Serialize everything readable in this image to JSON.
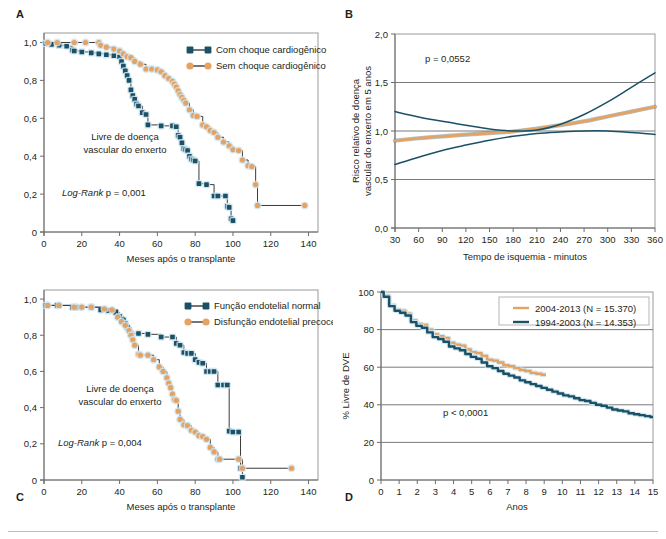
{
  "figure": {
    "panel_letters": {
      "a": "A",
      "b": "B",
      "c": "C",
      "d": "D"
    }
  },
  "colors": {
    "blue": "#1b5166",
    "orange": "#e4a263",
    "blue_legend_line": "#3a3a3a",
    "axis": "#6d6d6d",
    "grid": "#7a7a7a",
    "halo": "#cfe4ee",
    "text": "#231f20"
  },
  "chart_data": [
    {
      "id": "panel_a",
      "type": "line",
      "panel": "A",
      "title": "",
      "xlabel": "Meses após o transplante",
      "ylabel": "",
      "xlim": [
        0,
        145
      ],
      "ylim": [
        0,
        1.05
      ],
      "xticks": [
        0,
        20,
        40,
        60,
        80,
        100,
        120,
        140
      ],
      "xticklabels": [
        "0",
        "20",
        "40",
        "60",
        "80",
        "100",
        "120",
        "140"
      ],
      "yticks": [
        0,
        0.2,
        0.4,
        0.6,
        0.8,
        1.0
      ],
      "yticklabels": [
        "0",
        "0,2",
        "0,4",
        "0,6",
        "0,8",
        "1,0"
      ],
      "grid": false,
      "legend_position": "top-right",
      "annotations": [
        "Livre de doença",
        "vascular do enxerto",
        "Log-Rank p = 0,001"
      ],
      "annotation_stat": "Log-Rank p = 0,001",
      "series": [
        {
          "name": "Com choque cardiogênico",
          "color": "#1b5166",
          "marker": "square",
          "x": [
            1,
            4,
            8,
            12,
            15,
            16,
            20,
            25,
            29,
            33,
            37,
            40,
            41,
            42,
            43,
            44,
            45,
            46,
            47,
            48,
            49,
            50,
            52,
            54,
            55,
            62,
            68,
            70,
            71,
            72,
            73,
            74,
            75,
            76,
            77,
            78,
            79,
            80,
            82,
            86,
            90,
            92,
            96,
            97,
            98,
            99,
            100
          ],
          "y": [
            0.995,
            0.99,
            0.985,
            0.98,
            0.96,
            0.955,
            0.95,
            0.945,
            0.94,
            0.935,
            0.93,
            0.925,
            0.9,
            0.875,
            0.85,
            0.825,
            0.8,
            0.75,
            0.72,
            0.7,
            0.675,
            0.665,
            0.63,
            0.62,
            0.565,
            0.56,
            0.56,
            0.555,
            0.51,
            0.5,
            0.47,
            0.44,
            0.435,
            0.43,
            0.4,
            0.385,
            0.38,
            0.375,
            0.255,
            0.25,
            0.19,
            0.19,
            0.19,
            0.135,
            0.13,
            0.07,
            0.06
          ]
        },
        {
          "name": "Sem choque cardiogênico",
          "color": "#e4a263",
          "marker": "circle",
          "x": [
            2,
            7,
            16,
            22,
            29,
            30,
            33,
            37,
            40,
            42,
            44,
            46,
            48,
            51,
            54,
            57,
            60,
            62,
            64,
            66,
            68,
            69,
            70,
            71,
            72,
            73,
            74,
            75,
            77,
            79,
            81,
            84,
            86,
            88,
            90,
            92,
            95,
            98,
            100,
            103,
            105,
            108,
            110,
            112,
            113,
            138
          ],
          "y": [
            1.0,
            1.0,
            1.0,
            1.0,
            1.0,
            0.985,
            0.975,
            0.965,
            0.955,
            0.94,
            0.925,
            0.92,
            0.9,
            0.885,
            0.86,
            0.86,
            0.855,
            0.845,
            0.825,
            0.81,
            0.795,
            0.78,
            0.765,
            0.745,
            0.725,
            0.71,
            0.695,
            0.68,
            0.645,
            0.615,
            0.61,
            0.565,
            0.555,
            0.535,
            0.525,
            0.5,
            0.475,
            0.455,
            0.435,
            0.43,
            0.38,
            0.35,
            0.345,
            0.25,
            0.14,
            0.14
          ]
        }
      ]
    },
    {
      "id": "panel_b",
      "type": "line",
      "panel": "B",
      "title": "",
      "xlabel": "Tempo de isquemia - minutos",
      "ylabel": "Risco relativo de doença vascular do enxerto em 5 anos",
      "ylabel_lines": [
        "Risco relativo de doença",
        "vascular do enxerto em 5 anos"
      ],
      "xlim": [
        30,
        360
      ],
      "ylim": [
        0,
        2.0
      ],
      "xticks": [
        30,
        60,
        90,
        120,
        150,
        180,
        210,
        240,
        270,
        300,
        330,
        360
      ],
      "xticklabels": [
        "30",
        "60",
        "90",
        "120",
        "150",
        "180",
        "210",
        "240",
        "270",
        "300",
        "330",
        "360"
      ],
      "yticks": [
        0,
        0.5,
        1.0,
        1.5,
        2.0
      ],
      "yticklabels": [
        "0,0",
        "0,5",
        "1,0",
        "1,5",
        "2,0"
      ],
      "grid": true,
      "gridlines_y": [
        0.5,
        1.0,
        1.5
      ],
      "annotations": [
        "p = 0,0552"
      ],
      "annotation_stat": "p = 0,0552",
      "series": [
        {
          "name": "Estimativa",
          "color": "#e4a263",
          "x": [
            30,
            60,
            90,
            120,
            150,
            180,
            210,
            240,
            270,
            300,
            330,
            360
          ],
          "y": [
            0.9,
            0.925,
            0.945,
            0.962,
            0.978,
            0.995,
            1.025,
            1.06,
            1.1,
            1.15,
            1.2,
            1.25
          ]
        },
        {
          "name": "Limite superior",
          "color": "#1b5166",
          "x": [
            30,
            60,
            90,
            120,
            150,
            180,
            210,
            240,
            270,
            300,
            330,
            360
          ],
          "y": [
            1.2,
            1.145,
            1.1,
            1.06,
            1.02,
            1.0,
            1.01,
            1.07,
            1.17,
            1.3,
            1.45,
            1.6
          ]
        },
        {
          "name": "Limite inferior",
          "color": "#1b5166",
          "x": [
            30,
            60,
            90,
            120,
            150,
            180,
            210,
            240,
            270,
            300,
            330,
            360
          ],
          "y": [
            0.655,
            0.73,
            0.8,
            0.855,
            0.905,
            0.945,
            0.975,
            0.99,
            1.0,
            1.0,
            0.985,
            0.965
          ]
        }
      ]
    },
    {
      "id": "panel_c",
      "type": "line",
      "panel": "C",
      "title": "",
      "xlabel": "Meses após o transplante",
      "ylabel": "",
      "xlim": [
        0,
        145
      ],
      "ylim": [
        0,
        1.05
      ],
      "xticks": [
        0,
        20,
        40,
        60,
        80,
        100,
        120,
        140
      ],
      "xticklabels": [
        "0",
        "20",
        "40",
        "60",
        "80",
        "100",
        "120",
        "140"
      ],
      "yticks": [
        0,
        0.2,
        0.4,
        0.6,
        0.8,
        1.0
      ],
      "yticklabels": [
        "0",
        "0,2",
        "0,4",
        "0,6",
        "0,8",
        "1,0"
      ],
      "grid": false,
      "legend_position": "top-right",
      "annotations": [
        "Livre de doença",
        "vascular do enxerto",
        "Log-Rank p = 0,004"
      ],
      "annotation_stat": "Log-Rank p = 0,004",
      "series": [
        {
          "name": "Função endotelial normal",
          "color": "#1b5166",
          "marker": "square",
          "x": [
            1,
            7,
            15,
            17,
            25,
            30,
            34,
            38,
            40,
            42,
            43,
            44,
            46,
            50,
            55,
            62,
            68,
            70,
            72,
            74,
            76,
            78,
            80,
            82,
            84,
            86,
            88,
            90,
            92,
            95,
            97,
            98,
            100,
            103,
            104,
            105
          ],
          "y": [
            0.965,
            0.965,
            0.955,
            0.955,
            0.955,
            0.94,
            0.935,
            0.925,
            0.905,
            0.885,
            0.865,
            0.845,
            0.81,
            0.81,
            0.805,
            0.79,
            0.79,
            0.755,
            0.745,
            0.705,
            0.7,
            0.7,
            0.665,
            0.65,
            0.645,
            0.6,
            0.6,
            0.6,
            0.525,
            0.525,
            0.525,
            0.27,
            0.265,
            0.265,
            0.065,
            0.015
          ]
        },
        {
          "name": "Disfunção endotelial precoce",
          "color": "#e4a263",
          "marker": "circle",
          "x": [
            2,
            8,
            16,
            20,
            25,
            32,
            36,
            39,
            41,
            43,
            45,
            46,
            47,
            48,
            50,
            51,
            55,
            58,
            61,
            63,
            65,
            66,
            67,
            68,
            69,
            70,
            71,
            72,
            74,
            76,
            78,
            80,
            82,
            84,
            86,
            88,
            90,
            92,
            93,
            103,
            105,
            131
          ],
          "y": [
            0.965,
            0.965,
            0.955,
            0.955,
            0.955,
            0.945,
            0.94,
            0.9,
            0.875,
            0.855,
            0.825,
            0.8,
            0.775,
            0.745,
            0.695,
            0.69,
            0.69,
            0.665,
            0.625,
            0.6,
            0.565,
            0.535,
            0.51,
            0.475,
            0.445,
            0.44,
            0.38,
            0.335,
            0.305,
            0.3,
            0.275,
            0.265,
            0.245,
            0.24,
            0.225,
            0.18,
            0.155,
            0.115,
            0.115,
            0.115,
            0.065,
            0.065
          ]
        }
      ]
    },
    {
      "id": "panel_d",
      "type": "line",
      "panel": "D",
      "title": "",
      "xlabel": "Anos",
      "ylabel": "% Livre de DVE",
      "xlim": [
        0,
        15
      ],
      "ylim": [
        0,
        100
      ],
      "xticks": [
        0,
        1,
        2,
        3,
        4,
        5,
        6,
        7,
        8,
        9,
        10,
        11,
        12,
        13,
        14,
        15
      ],
      "xticklabels": [
        "0",
        "1",
        "2",
        "3",
        "4",
        "5",
        "6",
        "7",
        "8",
        "9",
        "10",
        "11",
        "12",
        "13",
        "14",
        "15"
      ],
      "yticks": [
        0,
        20,
        40,
        60,
        80,
        100
      ],
      "yticklabels": [
        "0",
        "20",
        "40",
        "60",
        "80",
        "100"
      ],
      "grid": true,
      "gridlines_y": [
        20,
        40,
        60,
        80
      ],
      "legend_position": "top-right",
      "annotations": [
        "p < 0,0001"
      ],
      "annotation_stat": "p < 0,0001",
      "series": [
        {
          "name": "2004-2013 (N = 15.370)",
          "color": "#e4a263",
          "x": [
            0,
            0.3,
            0.6,
            0.9,
            1.2,
            1.5,
            1.8,
            2.1,
            2.4,
            2.7,
            3.0,
            3.3,
            3.6,
            3.9,
            4.2,
            4.5,
            4.8,
            5.1,
            5.4,
            5.7,
            6.0,
            6.3,
            6.6,
            6.9,
            7.2,
            7.5,
            7.8,
            8.1,
            8.4,
            8.7,
            9.0,
            9.1
          ],
          "y": [
            100,
            98,
            93,
            90.5,
            90,
            88.5,
            85,
            83,
            82.5,
            80,
            77.5,
            76.5,
            75.5,
            73,
            72,
            71.5,
            69.5,
            68,
            67.5,
            66,
            64,
            63.5,
            62.5,
            61,
            60.5,
            59.5,
            58.5,
            58,
            57,
            56.5,
            56,
            56
          ]
        },
        {
          "name": "1994-2003 (N = 14.353)",
          "color": "#1b5166",
          "x": [
            0,
            0.3,
            0.6,
            0.9,
            1.2,
            1.5,
            1.8,
            2.1,
            2.4,
            2.7,
            3.0,
            3.3,
            3.6,
            3.9,
            4.2,
            4.5,
            4.8,
            5.1,
            5.4,
            5.7,
            6.0,
            6.3,
            6.6,
            6.9,
            7.2,
            7.5,
            7.8,
            8.1,
            8.4,
            8.7,
            9.0,
            9.3,
            9.6,
            9.9,
            10.2,
            10.5,
            10.8,
            11.1,
            11.4,
            11.7,
            12.0,
            12.3,
            12.6,
            12.9,
            13.2,
            13.5,
            13.8,
            14.1,
            14.4,
            14.7,
            15.0
          ],
          "y": [
            100,
            97.5,
            92.5,
            90,
            89,
            87.5,
            84,
            82,
            81,
            78.5,
            76,
            75,
            73.5,
            71,
            70,
            69,
            67,
            65.5,
            64.5,
            62.5,
            60.5,
            59.5,
            58,
            56.5,
            55.5,
            54.5,
            53,
            52,
            51,
            50,
            49,
            48,
            47,
            46,
            45,
            44.5,
            43.5,
            42.5,
            42,
            41,
            40,
            39.5,
            38.5,
            37.5,
            37,
            36.5,
            35.5,
            35,
            34.5,
            34,
            33.5
          ]
        }
      ]
    }
  ]
}
